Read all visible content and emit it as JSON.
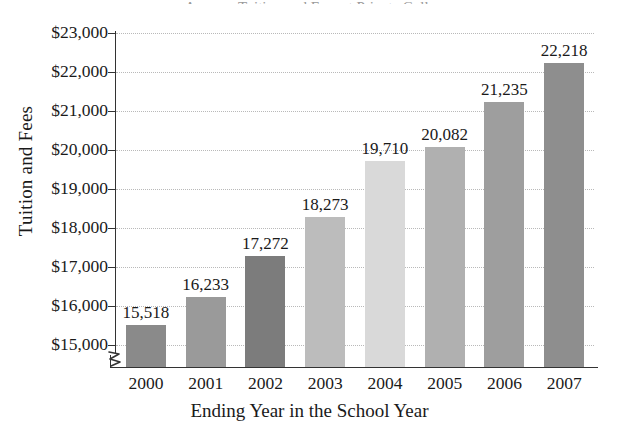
{
  "chart_data": {
    "type": "bar",
    "title": "",
    "xlabel": "Ending Year in the School Year",
    "ylabel": "Tuition and Fees",
    "categories": [
      "2000",
      "2001",
      "2002",
      "2003",
      "2004",
      "2005",
      "2006",
      "2007"
    ],
    "values": [
      15518,
      16233,
      17272,
      18273,
      19710,
      20082,
      21235,
      22218
    ],
    "value_labels": [
      "15,518",
      "16,233",
      "17,272",
      "18,273",
      "19,710",
      "20,082",
      "21,235",
      "22,218"
    ],
    "ylim": [
      14600,
      23000
    ],
    "y_axis_break": true,
    "y_tick_labels": [
      "$23,000",
      "$22,000",
      "$21,000",
      "$20,000",
      "$19,000",
      "$18,000",
      "$17,000",
      "$16,000",
      "$15,000"
    ],
    "y_tick_values": [
      23000,
      22000,
      21000,
      20000,
      19000,
      18000,
      17000,
      16000,
      15000
    ],
    "grid": true,
    "grid_style": "dotted",
    "grid_color": "#b9b9b9",
    "legend": "none",
    "bar_colors": [
      "#8a8a8a",
      "#9a9a9a",
      "#7c7c7c",
      "#bcbcbc",
      "#d9d9d9",
      "#b0b0b0",
      "#9e9e9e",
      "#8e8e8e"
    ],
    "axis_color": "#333333",
    "text_color": "#1a1a1a"
  },
  "title_remnant": "Average Tuition and Fees at Private Colleges"
}
